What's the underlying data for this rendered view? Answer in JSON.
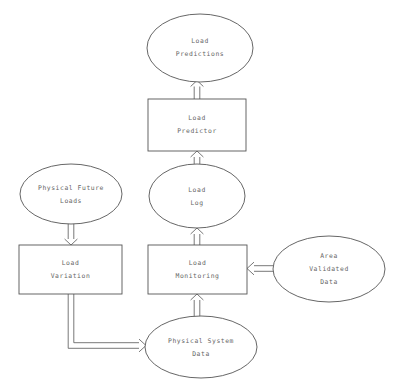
{
  "diagram": {
    "stroke_color": "#555555",
    "text_color": "#666666",
    "background_color": "#ffffff",
    "nodes": [
      {
        "id": "load-predictions",
        "shape": "ellipse",
        "lines": [
          "Load",
          "Predictions"
        ],
        "line1": "Load",
        "line2": "Predictions",
        "line3": ""
      },
      {
        "id": "load-predictor",
        "shape": "rectangle",
        "lines": [
          "Load",
          "Predictor"
        ],
        "line1": "Load",
        "line2": "Predictor",
        "line3": ""
      },
      {
        "id": "physical-future-loads",
        "shape": "ellipse",
        "lines": [
          "Physical Future",
          "Loads"
        ],
        "line1": "Physical Future",
        "line2": "Loads",
        "line3": ""
      },
      {
        "id": "load-log",
        "shape": "ellipse",
        "lines": [
          "Load",
          "Log"
        ],
        "line1": "Load",
        "line2": "Log",
        "line3": ""
      },
      {
        "id": "load-variation",
        "shape": "rectangle",
        "lines": [
          "Load",
          "Variation"
        ],
        "line1": "Load",
        "line2": "Variation",
        "line3": ""
      },
      {
        "id": "load-monitoring",
        "shape": "rectangle",
        "lines": [
          "Load",
          "Monitoring"
        ],
        "line1": "Load",
        "line2": "Monitoring",
        "line3": ""
      },
      {
        "id": "area-validated-data",
        "shape": "ellipse",
        "lines": [
          "Area",
          "Validated",
          "Data"
        ],
        "line1": "Area",
        "line2": "Validated",
        "line3": "Data"
      },
      {
        "id": "physical-system-data",
        "shape": "ellipse",
        "lines": [
          "Physical System",
          "Data"
        ],
        "line1": "Physical System",
        "line2": "Data",
        "line3": ""
      }
    ],
    "edges": [
      {
        "id": "predictor-to-predictions",
        "from": "load-predictor",
        "to": "load-predictions",
        "direction": "up",
        "style": "hollow-double-line"
      },
      {
        "id": "log-to-predictor",
        "from": "load-log",
        "to": "load-predictor",
        "direction": "up",
        "style": "hollow-double-line"
      },
      {
        "id": "monitoring-to-log",
        "from": "load-monitoring",
        "to": "load-log",
        "direction": "up",
        "style": "hollow-double-line"
      },
      {
        "id": "future-loads-to-variation",
        "from": "physical-future-loads",
        "to": "load-variation",
        "direction": "down",
        "style": "hollow-double-line"
      },
      {
        "id": "system-data-to-monitoring",
        "from": "physical-system-data",
        "to": "load-monitoring",
        "direction": "up",
        "style": "hollow-double-line"
      },
      {
        "id": "validated-data-to-monitoring",
        "from": "area-validated-data",
        "to": "load-monitoring",
        "direction": "left",
        "style": "hollow-double-line"
      },
      {
        "id": "variation-to-system-data",
        "from": "load-variation",
        "to": "physical-system-data",
        "direction": "down-right-elbow",
        "style": "hollow-double-line"
      }
    ]
  }
}
